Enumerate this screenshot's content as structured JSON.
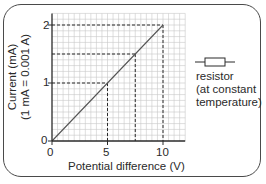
{
  "chart_data": {
    "type": "line",
    "title": "",
    "xlabel": "Potential difference (V)",
    "ylabel": "Current (mA)",
    "ylabel_sub": "(1 mA = 0.001 A)",
    "xlim": [
      0,
      12
    ],
    "ylim": [
      0,
      2.2
    ],
    "x_ticks": [
      0,
      5,
      10
    ],
    "y_ticks": [
      0,
      1,
      2
    ],
    "x_tick_labels": [
      "0",
      "5",
      "10"
    ],
    "y_tick_labels": [
      "0",
      "1",
      "2"
    ],
    "grid": true,
    "series": [
      {
        "name": "resistor (at constant temperature)",
        "x": [
          0,
          5,
          7.5,
          10
        ],
        "y": [
          0,
          1,
          1.5,
          2
        ]
      }
    ],
    "annotations": [
      {
        "type": "dashed-guide",
        "x": 5,
        "y": 1
      },
      {
        "type": "dashed-guide",
        "x": 7.5,
        "y": 1.5
      },
      {
        "type": "dashed-guide",
        "x": 10,
        "y": 2
      }
    ],
    "legend": {
      "symbol": "resistor-icon",
      "lines": [
        "resistor",
        "(at constant",
        "temperature)"
      ],
      "position": "right"
    }
  },
  "axes": {
    "x_label": "Potential difference (V)",
    "y_label_line1": "Current (mA)",
    "y_label_line2": "(1 mA = 0.001 A)",
    "x_tick_0": "0",
    "x_tick_5": "5",
    "x_tick_10": "10",
    "y_tick_0": "0",
    "y_tick_1": "1",
    "y_tick_2": "2"
  },
  "legend": {
    "line1": "resistor",
    "line2": "(at constant",
    "line3": "temperature)"
  },
  "colors": {
    "axis": "#2a2a2a",
    "grid": "#c8c8c8",
    "line": "#555555",
    "frame": "#4a4a4a"
  }
}
